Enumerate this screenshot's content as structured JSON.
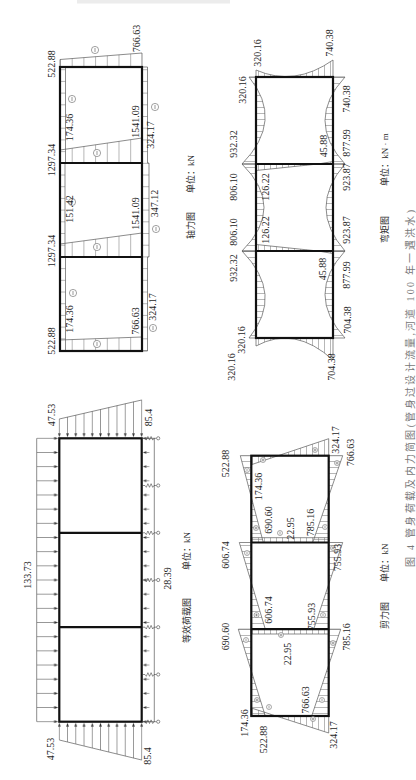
{
  "figure": {
    "caption": "图 4 管身荷载及内力简图(管身过设计流量,河道 100 年一遇洪水)"
  },
  "load_diagram": {
    "title": "等效荷载图",
    "unit": "单位：kN",
    "top_load": "133.73",
    "left_side_load": {
      "top": "47.53",
      "bottom": "85.4"
    },
    "right_side_load": {
      "top": "47.53",
      "bottom": "85.4"
    },
    "bottom_pressure": "28.39"
  },
  "axial_diagram": {
    "title": "轴力图",
    "unit": "单位：kN",
    "top_slab": {
      "left_cell": "174.36",
      "middle_cell": "151.42",
      "right_cell": "174.36"
    },
    "bottom_slab": {
      "left_cell": "324.17",
      "middle_cell": "347.12",
      "right_cell": "324.17"
    },
    "left_wall": {
      "top": "522.88",
      "bottom": "766.63"
    },
    "inner_wall_left": {
      "top": "1297.34",
      "bottom": "1541.09"
    },
    "inner_wall_right": {
      "top": "1297.34",
      "bottom": "1541.09"
    },
    "right_wall": {
      "top": "522.88",
      "bottom": "766.63"
    }
  },
  "shear_diagram": {
    "title": "剪力图",
    "unit": "单位：kN",
    "top_slab": {
      "left_cell": {
        "left_end": "522.88",
        "right_end": "690.60"
      },
      "middle_cell": {
        "left_end": "606.74",
        "right_end": "606.74"
      },
      "right_cell": {
        "left_end": "690.60",
        "right_end": "522.88"
      }
    },
    "bottom_slab": {
      "left_cell": {
        "left_end": "766.63",
        "right_end": "785.16"
      },
      "middle_cell": {
        "left_end": "755.93",
        "right_end": "755.93"
      },
      "right_cell": {
        "left_end": "785.16",
        "right_end": "766.63"
      }
    },
    "left_wall": {
      "top": "174.36",
      "bottom": "324.17"
    },
    "inner_wall_left": "22.95",
    "inner_wall_right": "22.95",
    "right_wall": {
      "top": "174.36",
      "bottom": "324.17"
    }
  },
  "moment_diagram": {
    "title": "弯矩图",
    "unit": "单位：kN · m",
    "top_slab": {
      "left_end": "320.16",
      "left_support": {
        "outer_side": "932.32",
        "middle_side": "806.10"
      },
      "right_support": {
        "middle_side": "806.10",
        "outer_side": "932.32"
      },
      "right_end": "320.16"
    },
    "bottom_slab": {
      "left_end": "704.38",
      "left_support": {
        "outer_side": "877.99",
        "middle_side": "923.87"
      },
      "right_support": {
        "middle_side": "923.87",
        "outer_side": "877.99"
      },
      "right_end": "740.38"
    },
    "left_wall": {
      "top": "320.16",
      "bottom": "704.38"
    },
    "inner_wall_left": {
      "top": "126.22",
      "bottom": "45.88"
    },
    "inner_wall_right": {
      "top": "126.22",
      "bottom": "45.88"
    },
    "right_wall": {
      "top": "320.16",
      "bottom": "740.38"
    }
  }
}
